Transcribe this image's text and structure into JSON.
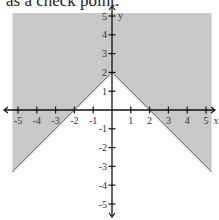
{
  "caption": "as a check point.",
  "chart_data": {
    "type": "area",
    "title": "",
    "boundary": {
      "equation": "y = -|x| + 2",
      "vertex": [
        0,
        2
      ],
      "x_intercepts": [
        -2,
        2
      ],
      "style": "solid"
    },
    "shaded": "above boundary",
    "xlabel": "x",
    "ylabel": "y",
    "xlim": [
      -5.3,
      5.3
    ],
    "ylim": [
      -5.5,
      5.5
    ],
    "x_ticks": [
      -5,
      -4,
      -3,
      -2,
      -1,
      1,
      2,
      3,
      4,
      5
    ],
    "y_ticks": [
      -5,
      -4,
      -3,
      -2,
      -1,
      1,
      2,
      3,
      4,
      5
    ],
    "grid": false,
    "colors": {
      "shade": "#c8c8c8",
      "axis": "#111111",
      "boundary": "#555555"
    }
  }
}
